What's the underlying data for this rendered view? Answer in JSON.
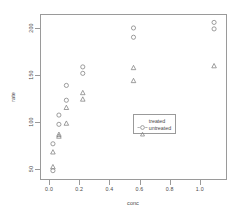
{
  "chart_data": {
    "type": "scatter",
    "title": "",
    "xlabel": "conc",
    "ylabel": "rate",
    "xlim": [
      -0.06,
      1.18
    ],
    "ylim": [
      38,
      215
    ],
    "xticks": [
      "0.0",
      "0.2",
      "0.4",
      "0.6",
      "0.8",
      "1.0"
    ],
    "xtickvals": [
      0.0,
      0.2,
      0.4,
      0.6,
      0.8,
      1.0
    ],
    "yticks": [
      "50",
      "100",
      "150",
      "200"
    ],
    "ytickvals": [
      50,
      100,
      150,
      200
    ],
    "grid": false,
    "legend_position": "center-right",
    "series": [
      {
        "name": "treated",
        "marker": "circle",
        "x": [
          0.02,
          0.02,
          0.06,
          0.06,
          0.11,
          0.11,
          0.22,
          0.22,
          0.56,
          0.56,
          1.1,
          1.1
        ],
        "y": [
          76,
          47,
          97,
          107,
          123,
          139,
          159,
          152,
          191,
          201,
          207,
          200
        ]
      },
      {
        "name": "untreated",
        "marker": "triangle",
        "x": [
          0.02,
          0.02,
          0.06,
          0.06,
          0.11,
          0.11,
          0.22,
          0.22,
          0.56,
          0.56,
          1.1
        ],
        "y": [
          67,
          51,
          84,
          86,
          98,
          115,
          131,
          124,
          144,
          158,
          160
        ]
      }
    ]
  },
  "legend": {
    "entries": [
      {
        "label": "treated"
      },
      {
        "label": "untreated"
      }
    ]
  },
  "colors": {
    "axis": "#9a9a9a",
    "text": "#4a4a4a",
    "marker": "#7d7d7d",
    "background": "#ffffff"
  }
}
